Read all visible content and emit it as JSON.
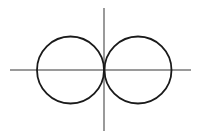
{
  "figure": {
    "background_color": "#ffffff",
    "width": 206,
    "height": 139
  },
  "chart_data": {
    "type": "line",
    "title": "",
    "subtitle": "",
    "xlabel": "",
    "ylabel": "",
    "grid": false,
    "legend": null,
    "legend_position": "none",
    "axes": {
      "x_axis": {
        "visible": true,
        "color": "#9a9a9a",
        "width": 1,
        "pixel_y": 70,
        "pixel_x_start": 10,
        "pixel_x_end": 191,
        "data_value": 0,
        "tick_labels": [],
        "arrowheads": false
      },
      "y_axis": {
        "visible": true,
        "color": "#9a9a9a",
        "width": 1,
        "pixel_x": 104,
        "pixel_y_start": 8,
        "pixel_y_end": 131,
        "data_value": 0,
        "tick_labels": [],
        "arrowheads": false
      },
      "origin_pixel": {
        "x": 104,
        "y": 70
      },
      "xlim": [
        -2.76,
        2.56
      ],
      "ylim": [
        -1.82,
        1.82
      ],
      "pixels_per_unit": 34
    },
    "series": [
      {
        "name": "left-circle",
        "shape": "circle",
        "equation": "(x + 1)^2 + y^2 = 1",
        "polar_equation": "r = -2 cos(theta)",
        "center_data": [
          -1,
          0
        ],
        "radius_data": 1,
        "center_pixel": [
          70.5,
          70
        ],
        "radius_pixel": 33.5,
        "stroke_color": "#1a1a1a",
        "stroke_width": 1.8,
        "fill": "none",
        "extent_pixel": {
          "left": 37,
          "right": 104,
          "top": 36.5,
          "bottom": 103.5
        }
      },
      {
        "name": "right-circle",
        "shape": "circle",
        "equation": "(x - 1)^2 + y^2 = 1",
        "polar_equation": "r = 2 cos(theta)",
        "center_data": [
          1,
          0
        ],
        "radius_data": 1,
        "center_pixel": [
          138,
          70
        ],
        "radius_pixel": 33.5,
        "stroke_color": "#1a1a1a",
        "stroke_width": 1.8,
        "fill": "none",
        "extent_pixel": {
          "left": 104.5,
          "right": 171.5,
          "top": 36.5,
          "bottom": 103.5
        }
      }
    ],
    "annotations": [
      {
        "name": "tangency-point",
        "label": "",
        "data_point": [
          0,
          0
        ],
        "pixel_point": [
          104,
          70
        ],
        "description": "Both circles are tangent to the y-axis and to each other at the origin"
      }
    ]
  }
}
